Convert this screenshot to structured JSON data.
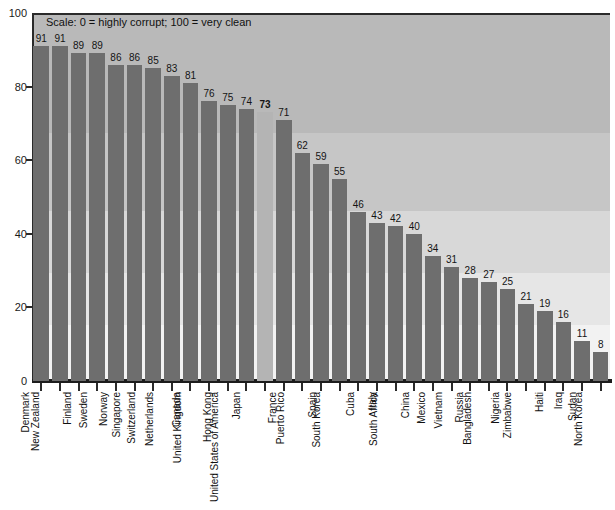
{
  "chart_data": {
    "type": "bar",
    "title": "",
    "subtitle": "",
    "annotation": "Scale: 0 = highly corrupt; 100 = very clean",
    "xlabel": "",
    "ylabel": "",
    "ylim": [
      0,
      100
    ],
    "yticks": [
      0,
      20,
      40,
      60,
      80,
      100
    ],
    "grid": false,
    "legend": "none",
    "highlight_category": "United States of America",
    "categories": [
      "Denmark",
      "New Zealand",
      "Finland",
      "Sweden",
      "Norway",
      "Singapore",
      "Switzerland",
      "Netherlands",
      "Canada",
      "United Kingdom",
      "Hong Kong",
      "Japan",
      "United States of America",
      "France",
      "Puerto Rico",
      "Spain",
      "South Korea",
      "Cuba",
      "Italy",
      "South Africa",
      "China",
      "Mexico",
      "Vietnam",
      "Russia",
      "Bangladesh",
      "Nigeria",
      "Zimbabwe",
      "Haiti",
      "Iraq",
      "Sudan",
      "North Korea"
    ],
    "values": [
      91,
      91,
      89,
      89,
      86,
      86,
      85,
      83,
      81,
      76,
      75,
      74,
      73,
      71,
      62,
      59,
      55,
      46,
      43,
      42,
      40,
      34,
      31,
      28,
      27,
      25,
      21,
      19,
      16,
      11,
      8
    ]
  },
  "colors": {
    "bar": "#6e6e6e",
    "bar_highlight": "#b4b4b4",
    "axis": "#2a2a2a",
    "text": "#111111",
    "background_top": "#b9b9b9",
    "background_bottom": "#f2f2f2"
  }
}
